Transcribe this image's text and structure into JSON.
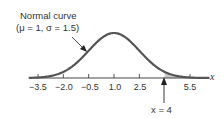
{
  "chart_data": {
    "type": "line",
    "title": "",
    "annotation_curve": {
      "line1": "Normal curve",
      "line2": "(μ = 1, σ = 1.5)"
    },
    "distribution": {
      "mean": 1,
      "sd": 1.5
    },
    "xlabel": "x",
    "ylabel": "",
    "x_ticks": [
      -3.5,
      -2.0,
      -0.5,
      1.0,
      2.5,
      5.5
    ],
    "x_tick_labels": [
      "−3.5",
      "−2.0",
      "−0.5",
      "1.0",
      "2.5",
      "5.5"
    ],
    "shaded_region": {
      "from": 4,
      "to": "infinity",
      "color": "#c8c8c8"
    },
    "marker": {
      "x": 4,
      "label": "x = 4"
    },
    "grid": false,
    "xlim": [
      -3.5,
      6.5
    ]
  },
  "labels": {
    "curve_line1": "Normal curve",
    "curve_line2": "(μ = 1, σ = 1.5)",
    "axis_x": "x",
    "marker_label": "x = 4",
    "ticks": [
      "−3.5",
      "−2.0",
      "−0.5",
      "1.0",
      "2.5",
      "5.5"
    ]
  },
  "colors": {
    "curve": "#555555",
    "axis": "#444444",
    "shade": "#c8c8c8"
  }
}
